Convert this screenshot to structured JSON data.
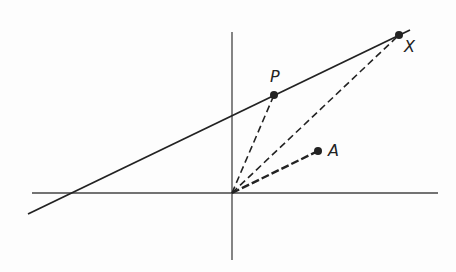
{
  "diagram": {
    "colors": {
      "ink": "#222222",
      "axis": "#444444",
      "background": "#fdfdfd"
    },
    "axes": {
      "horizontal": {
        "x1": 32,
        "y1": 193,
        "x2": 438,
        "y2": 193
      },
      "vertical": {
        "x1": 232,
        "y1": 32,
        "x2": 232,
        "y2": 260
      }
    },
    "origin": {
      "x": 232,
      "y": 193
    },
    "line": {
      "x1": 28,
      "y1": 214,
      "x2": 410,
      "y2": 30
    },
    "points": [
      {
        "id": "P",
        "label": "P",
        "x": 274,
        "y": 95,
        "label_x": 270,
        "label_y": 82
      },
      {
        "id": "X",
        "label": "X",
        "x": 399,
        "y": 35,
        "label_x": 404,
        "label_y": 52
      },
      {
        "id": "A",
        "label": "A",
        "x": 318,
        "y": 151,
        "label_x": 328,
        "label_y": 156
      }
    ],
    "dashed_segments": [
      {
        "from": "origin",
        "to": "P",
        "thick": false
      },
      {
        "from": "origin",
        "to": "X",
        "thick": false
      },
      {
        "from": "origin",
        "to": "A",
        "thick": true
      }
    ]
  }
}
